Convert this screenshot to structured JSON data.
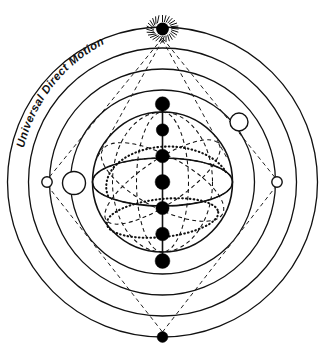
{
  "diagram": {
    "title_label": "Universal Direct Motion",
    "canvas": {
      "width": 325,
      "height": 359
    },
    "center": {
      "x": 162.5,
      "y": 182
    },
    "colors": {
      "stroke": "#111111",
      "fill_body": "#000000",
      "background": "#ffffff",
      "open_marker_fill": "#ffffff"
    },
    "orbit_rings": [
      {
        "name": "outermost-orbit",
        "radius": 155
      },
      {
        "name": "second-orbit",
        "radius": 134
      },
      {
        "name": "third-orbit",
        "radius": 113
      },
      {
        "name": "fourth-orbit",
        "radius": 92
      }
    ],
    "sphere": {
      "name": "central-sphere",
      "radius": 70
    },
    "equator_ellipse": {
      "rx": 70,
      "ry": 24
    },
    "lower_ring_ellipse": {
      "rx": 52,
      "ry": 18,
      "cy_offset": 36
    },
    "axis": {
      "x": 162.5,
      "y_top": 102,
      "y_bottom": 264
    },
    "planet_dots": [
      {
        "name": "planet-dot-1",
        "cx": 162.5,
        "cy": 104,
        "r": 7.2
      },
      {
        "name": "planet-dot-2",
        "cx": 162.5,
        "cy": 130,
        "r": 6.2
      },
      {
        "name": "planet-dot-3",
        "cx": 162.5,
        "cy": 156,
        "r": 6.8
      },
      {
        "name": "planet-dot-4",
        "cx": 162.5,
        "cy": 182,
        "r": 7.4
      },
      {
        "name": "planet-dot-5",
        "cx": 162.5,
        "cy": 208,
        "r": 6.6
      },
      {
        "name": "planet-dot-6",
        "cx": 162.5,
        "cy": 234,
        "r": 6.8
      },
      {
        "name": "planet-dot-7",
        "cx": 162.5,
        "cy": 261,
        "r": 7.4
      }
    ],
    "sun": {
      "name": "sun-symbol",
      "cx": 162.5,
      "cy": 30,
      "core_r": 6.2,
      "ray_count": 28,
      "ray_inner": 8,
      "ray_outer": 15
    },
    "bottom_node": {
      "name": "bottom-node",
      "cx": 162.5,
      "cy": 337,
      "r": 5.2
    },
    "open_markers": [
      {
        "name": "marker-left-outer",
        "cx": 47,
        "cy": 182,
        "r": 5.2
      },
      {
        "name": "marker-left-large",
        "cx": 74,
        "cy": 183,
        "r": 11.5
      },
      {
        "name": "marker-right-outer",
        "cx": 277,
        "cy": 182,
        "r": 5.2
      },
      {
        "name": "marker-upper-right",
        "cx": 239,
        "cy": 122,
        "r": 9.0
      }
    ],
    "dashed_connectors": [
      {
        "name": "ray-sun-to-left",
        "x1": 162.5,
        "y1": 36,
        "x2": 47,
        "y2": 182
      },
      {
        "name": "ray-sun-to-right",
        "x1": 162.5,
        "y1": 36,
        "x2": 277,
        "y2": 182
      },
      {
        "name": "ray-left-to-bottom",
        "x1": 47,
        "y1": 182,
        "x2": 162.5,
        "y2": 333
      },
      {
        "name": "ray-right-to-bottom",
        "x1": 277,
        "y1": 182,
        "x2": 162.5,
        "y2": 333
      }
    ]
  }
}
